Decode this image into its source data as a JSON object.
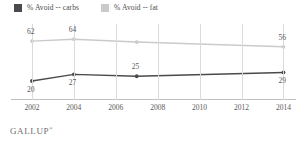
{
  "legend": {
    "position": "top-left",
    "items": [
      {
        "label": "% Avoid -- carbs",
        "color": "#4a4a4c",
        "name": "legend-carbs"
      },
      {
        "label": "% Avoid -- fat",
        "color": "#c9cacc",
        "name": "legend-fat"
      }
    ]
  },
  "footer": {
    "brand": "GALLUP",
    "trademark": "®"
  },
  "chart_data": {
    "type": "line",
    "title": "",
    "subtitle": "",
    "xlabel": "",
    "ylabel": "",
    "grid": "vertical",
    "legend_position": "top-left",
    "x": [
      2002,
      2004,
      2007,
      2014
    ],
    "xlim": [
      2001,
      2014.6
    ],
    "ylim": [
      0,
      80
    ],
    "xticks": [
      "2002",
      "2004",
      "2006",
      "2008",
      "2010",
      "2012",
      "2014"
    ],
    "xtick_values": [
      2002,
      2004,
      2006,
      2008,
      2010,
      2012,
      2014
    ],
    "yticks": [],
    "series": [
      {
        "name": "% Avoid -- fat",
        "color": "#c9cacc",
        "x": [
          2002,
          2004,
          2007,
          2014
        ],
        "values": [
          62,
          64,
          61,
          56
        ],
        "labels": [
          {
            "text": "62",
            "x": 2002,
            "y": 62,
            "pos": "above"
          },
          {
            "text": "64",
            "x": 2004,
            "y": 64,
            "pos": "above"
          },
          {
            "text": "56",
            "x": 2014,
            "y": 56,
            "pos": "above"
          }
        ]
      },
      {
        "name": "% Avoid -- carbs",
        "color": "#4a4a4c",
        "x": [
          2002,
          2004,
          2007,
          2014
        ],
        "values": [
          20,
          27,
          25,
          29
        ],
        "labels": [
          {
            "text": "20",
            "x": 2002,
            "y": 20,
            "pos": "below"
          },
          {
            "text": "27",
            "x": 2004,
            "y": 27,
            "pos": "below"
          },
          {
            "text": "25",
            "x": 2007,
            "y": 25,
            "pos": "above"
          },
          {
            "text": "29",
            "x": 2014,
            "y": 29,
            "pos": "below"
          }
        ]
      }
    ]
  }
}
